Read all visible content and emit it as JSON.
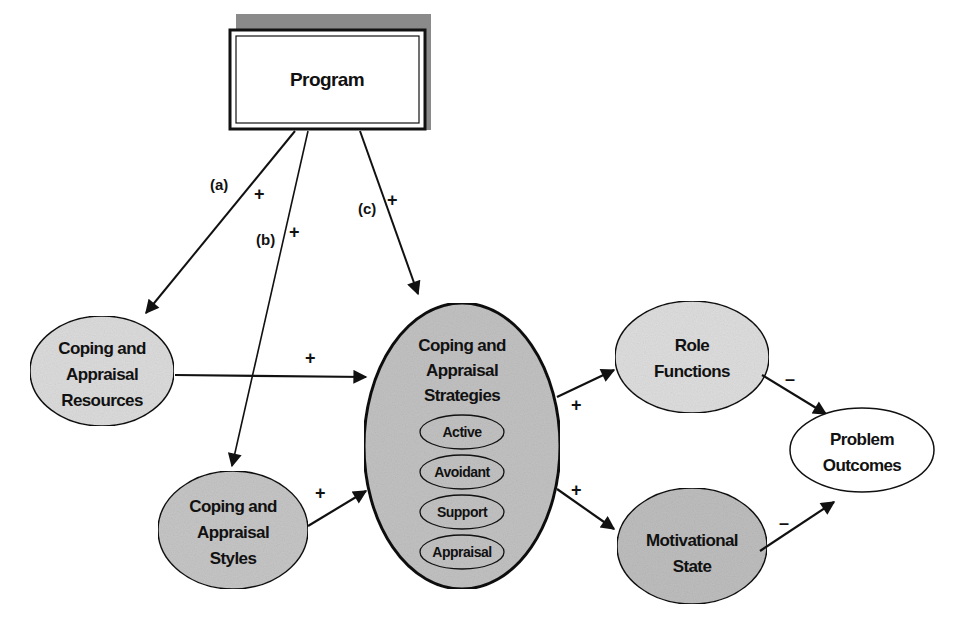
{
  "diagram": {
    "colors": {
      "background": "#ffffff",
      "stroke": "#111111",
      "fill_light": "#e4e4e4",
      "fill_medium": "#cfcfcf",
      "fill_dark": "#bdbdbd",
      "program_shadow": "#8a8a8a"
    },
    "nodes": {
      "program": {
        "label": "Program"
      },
      "resources": {
        "lines": [
          "Coping and",
          "Appraisal",
          "Resources"
        ]
      },
      "styles": {
        "lines": [
          "Coping and",
          "Appraisal",
          "Styles"
        ]
      },
      "strategies": {
        "lines": [
          "Coping and",
          "Appraisal",
          "Strategies"
        ],
        "sub_items": [
          "Active",
          "Avoidant",
          "Support",
          "Appraisal"
        ]
      },
      "role_functions": {
        "lines": [
          "Role",
          "Functions"
        ]
      },
      "motivational_state": {
        "lines": [
          "Motivational",
          "State"
        ]
      },
      "problem_outcomes": {
        "lines": [
          "Problem",
          "Outcomes"
        ]
      }
    },
    "edges": {
      "a": {
        "label": "(a)",
        "sign": "+",
        "from": "Program",
        "to": "Coping and Appraisal Resources"
      },
      "b": {
        "label": "(b)",
        "sign": "+",
        "from": "Program",
        "to": "Coping and Appraisal Styles"
      },
      "c": {
        "label": "(c)",
        "sign": "+",
        "from": "Program",
        "to": "Coping and Appraisal Strategies"
      },
      "resources_to_strategies": {
        "sign": "+"
      },
      "styles_to_strategies": {
        "sign": "+"
      },
      "strategies_to_role": {
        "sign": "+"
      },
      "strategies_to_motivation": {
        "sign": "+"
      },
      "role_to_outcomes": {
        "sign": "–"
      },
      "motivation_to_outcomes": {
        "sign": "–"
      }
    }
  }
}
